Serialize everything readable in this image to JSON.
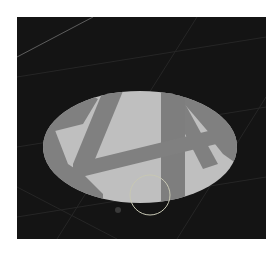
{
  "scene": {
    "background_color": "#141414",
    "page_background": "#ffffff",
    "spotlight": {
      "lit_color": "#bfbfbf",
      "shadow_color": "#7f7f7f"
    },
    "gizmo": {
      "type": "circle",
      "stroke_color": "#c8c8b4"
    },
    "grid_line_color": "#2a2a2a",
    "highlight_line_color": "#6a6a6a"
  }
}
